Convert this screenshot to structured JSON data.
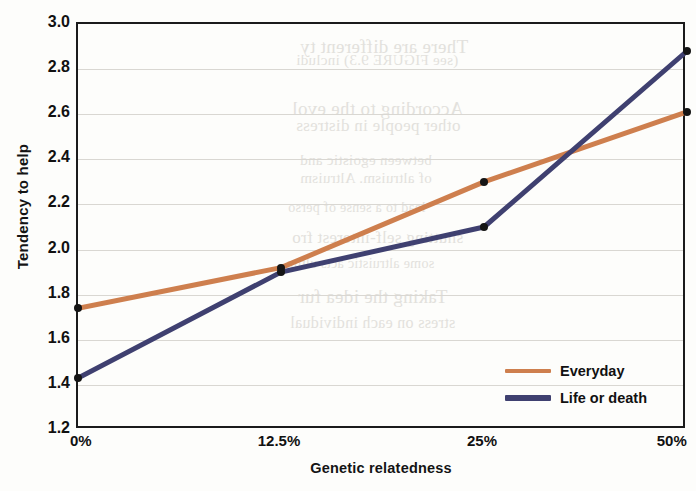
{
  "chart_data": {
    "type": "line",
    "title": "",
    "xlabel": "Genetic relatedness",
    "ylabel": "Tendency to help",
    "categories": [
      "0%",
      "12.5%",
      "25%",
      "50%"
    ],
    "ylim": [
      1.2,
      3.0
    ],
    "ytick_labels": [
      "3.0",
      "2.8",
      "2.6",
      "2.4",
      "2.2",
      "2.0",
      "1.8",
      "1.6",
      "1.4",
      "1.2"
    ],
    "ytick_values": [
      3.0,
      2.8,
      2.6,
      2.4,
      2.2,
      2.0,
      1.8,
      1.6,
      1.4,
      1.2
    ],
    "grid": true,
    "legend_position": "bottom-right",
    "series": [
      {
        "name": "Everyday",
        "color": "#ce7f4e",
        "values": [
          1.74,
          1.92,
          2.3,
          2.61
        ]
      },
      {
        "name": "Life or death",
        "color": "#3f4070",
        "values": [
          1.43,
          1.9,
          2.1,
          2.88
        ]
      }
    ]
  },
  "legend": {
    "items": [
      {
        "label": "Everyday"
      },
      {
        "label": "Life or death"
      }
    ]
  },
  "ghost_text": {
    "lines": [
      "There are different ty",
      "(see FIGURE 9.3) includi",
      "According to the evol",
      "other people in distress",
      "between egoistic and",
      "of altruism. Altruism",
      "lead to a sense of perso",
      "shutting self-interest fro",
      "some altruistic acts ultim",
      "Taking the idea fur",
      "stress on each individual"
    ]
  }
}
